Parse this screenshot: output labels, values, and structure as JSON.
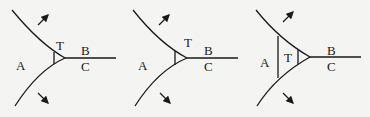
{
  "diagram": {
    "panels": [
      {
        "id": "panel-1",
        "labels": {
          "A": "A",
          "B": "B",
          "C": "C",
          "T": "T"
        },
        "description": "Small triangular grain T at the triple junction of A, B, C"
      },
      {
        "id": "panel-2",
        "labels": {
          "A": "A",
          "B": "B",
          "C": "C",
          "T": "T"
        },
        "description": "Triangular grain T slightly larger, at junction"
      },
      {
        "id": "panel-3",
        "labels": {
          "A": "A",
          "B": "B",
          "C": "C",
          "T": "T"
        },
        "description": "Larger triangular grain T growing into A, with inner boundary"
      }
    ],
    "colors": {
      "line": "#1a1a1a",
      "background": "#f4f4f2"
    }
  }
}
